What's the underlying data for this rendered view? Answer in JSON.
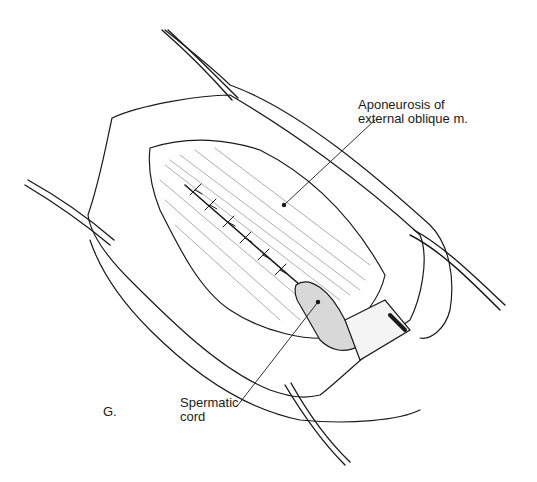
{
  "figure": {
    "panel_letter": "G.",
    "labels": [
      {
        "id": "aponeurosis",
        "line1": "Aponeurosis of",
        "line2": "external oblique m."
      },
      {
        "id": "spermatic_cord",
        "line1": "Spermatic",
        "line2": "cord"
      }
    ],
    "colors": {
      "ink": "#1a1a1a",
      "background": "#ffffff"
    }
  }
}
